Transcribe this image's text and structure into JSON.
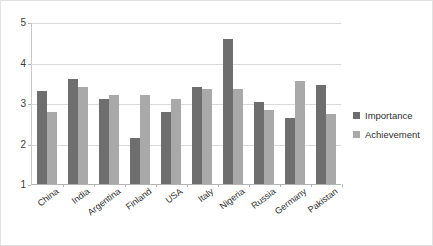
{
  "chart_data": {
    "type": "bar",
    "title": "",
    "xlabel": "",
    "ylabel": "",
    "ylim": [
      1,
      5
    ],
    "yticks": [
      1,
      2,
      3,
      4,
      5
    ],
    "grid": true,
    "legend_position": "right",
    "categories": [
      "China",
      "India",
      "Argentina",
      "Finland",
      "USA",
      "Italy",
      "Nigeria",
      "Russia",
      "Germany",
      "Pakistan"
    ],
    "series": [
      {
        "name": "Importance",
        "color": "#6e6e6e",
        "values": [
          3.3,
          3.6,
          3.1,
          2.15,
          2.8,
          3.4,
          4.6,
          3.05,
          2.65,
          3.45
        ]
      },
      {
        "name": "Achievement",
        "color": "#a9a9a9",
        "values": [
          2.8,
          3.4,
          3.2,
          3.2,
          3.1,
          3.35,
          3.35,
          2.85,
          3.55,
          2.75
        ]
      }
    ]
  }
}
